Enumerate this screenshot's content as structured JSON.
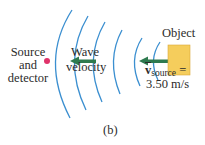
{
  "diagram": {
    "source_detector_label": [
      "Source",
      "and",
      "detector"
    ],
    "wave_velocity_label": [
      "Wave",
      "velocity"
    ],
    "object_label": "Object",
    "velocity_symbol": "v",
    "velocity_subscript": "source",
    "velocity_equals": "=",
    "velocity_value": "3.50 m/s",
    "panel_label": "(b)",
    "colors": {
      "wavefront": "#3b8fd0",
      "arrow": "#2e7a4f",
      "object_fill": "#f5cd5c",
      "object_stroke": "#d9a93a",
      "dot": "#e0336a",
      "text": "#2b2b2b"
    },
    "wavefront_count": 6
  }
}
